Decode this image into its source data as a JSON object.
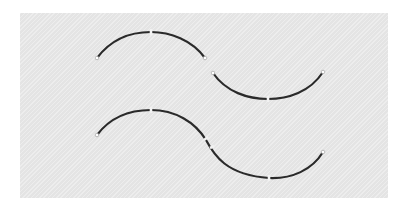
{
  "diagram": {
    "background": "#e4e4e4",
    "stroke_color": "#2a2a2a",
    "top_row": {
      "description": "two separate arcs",
      "arc_a": {
        "shape": "convex",
        "start": [
          97,
          58
        ],
        "peak": [
          150,
          33
        ],
        "end": [
          205,
          58
        ],
        "midpoint_marker": [
          151,
          33
        ]
      },
      "arc_b": {
        "shape": "concave",
        "start": [
          211,
          72
        ],
        "trough": [
          268,
          99
        ],
        "end": [
          323,
          72
        ],
        "midpoint_marker": [
          268,
          99
        ]
      }
    },
    "bottom_row": {
      "description": "continuous S-curve joined at inflection",
      "start": [
        97,
        135
      ],
      "peak": [
        151,
        110
      ],
      "inflection": [
        207,
        146
      ],
      "trough": [
        269,
        179
      ],
      "end": [
        323,
        152
      ]
    }
  }
}
